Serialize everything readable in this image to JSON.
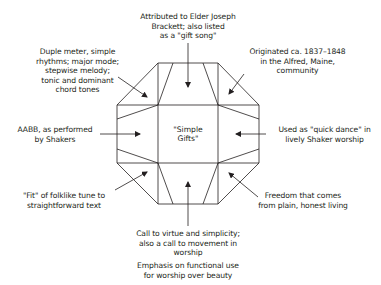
{
  "diagram": {
    "title": "\"Simple Gifts\"",
    "center_lines": [
      "\"Simple",
      "Gifts\""
    ],
    "colors": {
      "stroke": "#231f20",
      "background": "#ffffff",
      "text": "#231f20"
    },
    "annotations": {
      "top": [
        "Attributed to Elder Joseph",
        "Brackett; also listed",
        "as a \"gift song\""
      ],
      "top_right": [
        "Originated ca. 1837–1848",
        "in the Alfred, Maine,",
        "community"
      ],
      "right": [
        "Used as \"quick dance\" in",
        "lively Shaker worship"
      ],
      "bottom_right": [
        "Freedom that comes",
        "from plain, honest living"
      ],
      "bottom": [
        "Call to virtue and simplicity;",
        "also a call to movement in",
        "worship"
      ],
      "bottom_extra": [
        "Emphasis on functional use",
        "for worship over beauty"
      ],
      "bottom_left": [
        "\"Fit\" of folklike tune to",
        "straightforward text"
      ],
      "left": [
        "AABB, as performed",
        "by Shakers"
      ],
      "top_left": [
        "Duple meter, simple",
        "rhythms; major mode;",
        "stepwise melody;",
        "tonic and dominant",
        "chord tones"
      ]
    }
  }
}
